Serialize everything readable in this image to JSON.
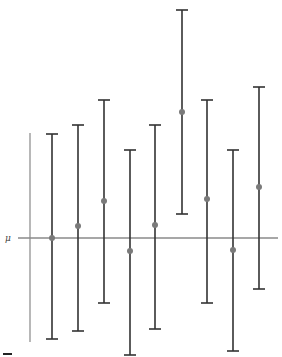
{
  "chart_data": {
    "type": "errorbar",
    "title": "",
    "xlabel": "",
    "ylabel": "",
    "reference_line": {
      "label": "μ",
      "value": 0
    },
    "grid": false,
    "legend": null,
    "x": [
      1,
      2,
      3,
      4,
      5,
      6,
      7,
      8,
      9
    ],
    "series": [
      {
        "name": "confidence intervals",
        "points": [
          0.0,
          1.2,
          3.7,
          -1.3,
          1.3,
          12.6,
          3.9,
          -1.2,
          5.1
        ],
        "upper": [
          10.4,
          11.3,
          13.8,
          8.8,
          11.3,
          22.8,
          13.8,
          8.8,
          15.1
        ],
        "lower": [
          -10.1,
          -9.3,
          -6.5,
          -11.7,
          -9.1,
          2.4,
          -6.5,
          -11.3,
          -5.1
        ]
      }
    ],
    "ylim": [
      -12,
      23
    ]
  },
  "colors": {
    "bar": "#333333",
    "point": "#7a7a7a",
    "reference_line": "#8a8a8a",
    "axis": "#888888"
  },
  "labels": {
    "mu": "μ"
  }
}
